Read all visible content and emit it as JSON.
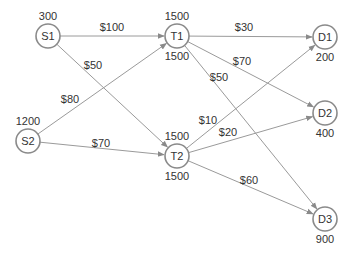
{
  "diagram": {
    "title": "",
    "colors": {
      "edge": "#9a9a9a",
      "node_stroke": "#8a8a8a",
      "text": "#333333"
    },
    "nodes": [
      {
        "id": "S1",
        "label": "S1",
        "x": 48,
        "y": 36,
        "values": [
          {
            "text": "300",
            "pos": "above"
          }
        ]
      },
      {
        "id": "S2",
        "label": "S2",
        "x": 28,
        "y": 141,
        "values": [
          {
            "text": "1200",
            "pos": "above"
          }
        ]
      },
      {
        "id": "T1",
        "label": "T1",
        "x": 177,
        "y": 36,
        "values": [
          {
            "text": "1500",
            "pos": "above"
          },
          {
            "text": "1500",
            "pos": "below"
          }
        ]
      },
      {
        "id": "T2",
        "label": "T2",
        "x": 177,
        "y": 156,
        "values": [
          {
            "text": "1500",
            "pos": "above"
          },
          {
            "text": "1500",
            "pos": "below"
          }
        ]
      },
      {
        "id": "D1",
        "label": "D1",
        "x": 325,
        "y": 37,
        "values": [
          {
            "text": "200",
            "pos": "below"
          }
        ]
      },
      {
        "id": "D2",
        "label": "D2",
        "x": 325,
        "y": 113,
        "values": [
          {
            "text": "400",
            "pos": "below"
          }
        ]
      },
      {
        "id": "D3",
        "label": "D3",
        "x": 325,
        "y": 219,
        "values": [
          {
            "text": "900",
            "pos": "below"
          }
        ]
      }
    ],
    "edges": [
      {
        "from": "S1",
        "to": "T1",
        "label": "$100",
        "lx": 112,
        "ly": 31
      },
      {
        "from": "S1",
        "to": "T2",
        "label": "$50",
        "lx": 93,
        "ly": 69
      },
      {
        "from": "S2",
        "to": "T1",
        "label": "$80",
        "lx": 70,
        "ly": 103
      },
      {
        "from": "S2",
        "to": "T2",
        "label": "$70",
        "lx": 101,
        "ly": 147
      },
      {
        "from": "T1",
        "to": "D1",
        "label": "$30",
        "lx": 244,
        "ly": 31
      },
      {
        "from": "T1",
        "to": "D2",
        "label": "$70",
        "lx": 242,
        "ly": 65
      },
      {
        "from": "T1",
        "to": "D3",
        "label": "$50",
        "lx": 219,
        "ly": 81
      },
      {
        "from": "T2",
        "to": "D1",
        "label": "$10",
        "lx": 208,
        "ly": 124
      },
      {
        "from": "T2",
        "to": "D2",
        "label": "$20",
        "lx": 228,
        "ly": 136
      },
      {
        "from": "T2",
        "to": "D3",
        "label": "$60",
        "lx": 249,
        "ly": 184
      }
    ]
  }
}
